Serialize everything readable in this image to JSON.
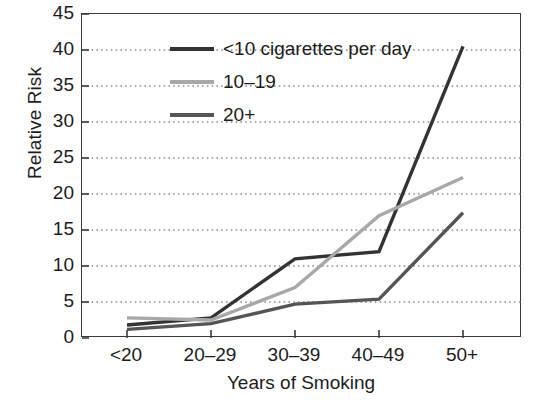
{
  "chart_data": {
    "type": "line",
    "title": "",
    "xlabel": "Years of Smoking",
    "ylabel": "Relative Risk",
    "categories": [
      "<20",
      "20–29",
      "30–39",
      "40–49",
      "50+"
    ],
    "ylim": [
      0,
      45
    ],
    "yticks": [
      0,
      5,
      10,
      15,
      20,
      25,
      30,
      35,
      40,
      45
    ],
    "ytick_labels": [
      "0",
      "5",
      "10",
      "15",
      "20",
      "25",
      "30",
      "35",
      "40",
      "45"
    ],
    "grid": "horizontal-dotted",
    "legend_position": "top-left-inside",
    "series": [
      {
        "name": "<10 cigarettes per day",
        "color": "#333333",
        "values": [
          1.8,
          2.8,
          11.0,
          12.0,
          40.5
        ]
      },
      {
        "name": "10–19",
        "color": "#a8a8a8",
        "values": [
          2.8,
          2.5,
          7.0,
          17.0,
          22.3
        ]
      },
      {
        "name": "20+",
        "color": "#555555",
        "values": [
          1.2,
          2.0,
          4.7,
          5.4,
          17.4
        ]
      }
    ]
  },
  "axes": {
    "ylabel": "Relative Risk",
    "xlabel": "Years of Smoking"
  },
  "legend": {
    "items": [
      {
        "label": "<10 cigarettes per day",
        "color": "#333333"
      },
      {
        "label": "10–19",
        "color": "#a8a8a8"
      },
      {
        "label": "20+",
        "color": "#555555"
      }
    ]
  }
}
